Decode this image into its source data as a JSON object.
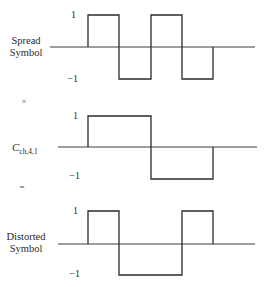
{
  "panels": [
    {
      "label_lines": [
        "Spread",
        "Symbol"
      ],
      "tick_high": "1",
      "tick_low": "−1",
      "values": [
        0,
        1,
        -1,
        1,
        -1,
        0
      ],
      "baseline_y": 47,
      "high_y": 15,
      "low_y": 79,
      "axis_start_x": 50,
      "axis_end_x": 255
    },
    {
      "label_main": "C",
      "label_sub": "ch,4,1",
      "tick_high": "1",
      "tick_low": "−1",
      "values": [
        0,
        1,
        1,
        -1,
        -1,
        0
      ],
      "baseline_y": 147,
      "high_y": 116,
      "low_y": 179,
      "axis_start_x": 58,
      "axis_end_x": 257
    },
    {
      "label_lines": [
        "Distorted",
        "Symbol"
      ],
      "tick_high": "1",
      "tick_low": "−1",
      "values": [
        0,
        1,
        -1,
        -1,
        1,
        0
      ],
      "baseline_y": 244,
      "high_y": 211,
      "low_y": 275,
      "axis_start_x": 58,
      "axis_end_x": 255
    }
  ],
  "operators": {
    "multiply": "×",
    "equals": "="
  },
  "chip_edges_x": [
    50,
    88,
    119,
    151,
    182,
    213,
    255
  ],
  "colors": {
    "line": "#2a2a2a",
    "background": "#ffffff"
  }
}
